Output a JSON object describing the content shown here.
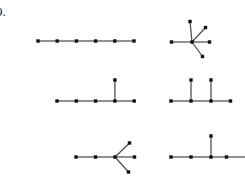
{
  "figure": {
    "label": "9.",
    "background_color": "#ffffff",
    "node_color": "#111111",
    "edge_color": "#4d4d4d",
    "node_size": 3.4,
    "edge_width": 1.25,
    "width": 245,
    "height": 186
  },
  "graphs": [
    {
      "id": "graph-top-left",
      "name": "path-six-nodes",
      "description": "Path graph on 6 vertices",
      "nodes": [
        {
          "id": "n0",
          "x": 38.0,
          "y": 41.0
        },
        {
          "id": "n1",
          "x": 57.2,
          "y": 41.0
        },
        {
          "id": "n2",
          "x": 76.4,
          "y": 41.0
        },
        {
          "id": "n3",
          "x": 95.6,
          "y": 41.0
        },
        {
          "id": "n4",
          "x": 114.8,
          "y": 41.0
        },
        {
          "id": "n5",
          "x": 134.0,
          "y": 41.0
        }
      ],
      "edges": [
        [
          "n0",
          "n1"
        ],
        [
          "n1",
          "n2"
        ],
        [
          "n2",
          "n3"
        ],
        [
          "n3",
          "n4"
        ],
        [
          "n4",
          "n5"
        ]
      ]
    },
    {
      "id": "graph-top-right",
      "name": "star-five-leaves",
      "description": "Star graph with one centre and five leaves",
      "nodes": [
        {
          "id": "c",
          "x": 192.0,
          "y": 42.0
        },
        {
          "id": "l0",
          "x": 171.5,
          "y": 42.0
        },
        {
          "id": "l1",
          "x": 190.0,
          "y": 21.5
        },
        {
          "id": "l2",
          "x": 205.5,
          "y": 27.5
        },
        {
          "id": "l3",
          "x": 209.5,
          "y": 42.0
        },
        {
          "id": "l4",
          "x": 202.5,
          "y": 56.5
        }
      ],
      "edges": [
        [
          "c",
          "l0"
        ],
        [
          "c",
          "l1"
        ],
        [
          "c",
          "l2"
        ],
        [
          "c",
          "l3"
        ],
        [
          "c",
          "l4"
        ]
      ]
    },
    {
      "id": "graph-mid-left",
      "name": "path-five-with-branch-at-fourth",
      "description": "Path on 5 vertices with one pendant vertex above the fourth",
      "nodes": [
        {
          "id": "n0",
          "x": 57.0,
          "y": 101.0
        },
        {
          "id": "n1",
          "x": 76.3,
          "y": 101.0
        },
        {
          "id": "n2",
          "x": 95.6,
          "y": 101.0
        },
        {
          "id": "n3",
          "x": 114.9,
          "y": 101.0
        },
        {
          "id": "n4",
          "x": 134.2,
          "y": 101.0
        },
        {
          "id": "b0",
          "x": 114.9,
          "y": 80.0
        }
      ],
      "edges": [
        [
          "n0",
          "n1"
        ],
        [
          "n1",
          "n2"
        ],
        [
          "n2",
          "n3"
        ],
        [
          "n3",
          "n4"
        ],
        [
          "n3",
          "b0"
        ]
      ]
    },
    {
      "id": "graph-mid-right",
      "name": "path-four-with-two-branches",
      "description": "Path on 4 vertices with pendant vertices above the second and third",
      "nodes": [
        {
          "id": "n0",
          "x": 171.0,
          "y": 101.0
        },
        {
          "id": "n1",
          "x": 191.0,
          "y": 101.0
        },
        {
          "id": "n2",
          "x": 211.0,
          "y": 101.0
        },
        {
          "id": "n3",
          "x": 230.5,
          "y": 101.0
        },
        {
          "id": "b0",
          "x": 191.0,
          "y": 80.0
        },
        {
          "id": "b1",
          "x": 211.0,
          "y": 80.0
        }
      ],
      "edges": [
        [
          "n0",
          "n1"
        ],
        [
          "n1",
          "n2"
        ],
        [
          "n2",
          "n3"
        ],
        [
          "n1",
          "b0"
        ],
        [
          "n2",
          "b1"
        ]
      ]
    },
    {
      "id": "graph-bottom-left",
      "name": "path-three-with-three-way-fan",
      "description": "Path on 3 vertices ending in a vertex with three spread branches",
      "nodes": [
        {
          "id": "n0",
          "x": 76.0,
          "y": 157.0
        },
        {
          "id": "n1",
          "x": 95.5,
          "y": 157.0
        },
        {
          "id": "n2",
          "x": 115.0,
          "y": 157.0
        },
        {
          "id": "b0",
          "x": 129.5,
          "y": 143.0
        },
        {
          "id": "b1",
          "x": 134.5,
          "y": 157.0
        },
        {
          "id": "b2",
          "x": 128.5,
          "y": 172.0
        }
      ],
      "edges": [
        [
          "n0",
          "n1"
        ],
        [
          "n1",
          "n2"
        ],
        [
          "n2",
          "b0"
        ],
        [
          "n2",
          "b1"
        ],
        [
          "n2",
          "b2"
        ]
      ]
    },
    {
      "id": "graph-bottom-right",
      "name": "path-four-with-branch-at-third",
      "description": "Path on 4 vertices with one pendant vertex above the third; right edge runs off the figure",
      "nodes": [
        {
          "id": "n0",
          "x": 171.0,
          "y": 157.0
        },
        {
          "id": "n1",
          "x": 191.0,
          "y": 157.0
        },
        {
          "id": "n2",
          "x": 211.0,
          "y": 157.0
        },
        {
          "id": "n3",
          "x": 226.5,
          "y": 157.0
        },
        {
          "id": "b0",
          "x": 211.0,
          "y": 136.0
        }
      ],
      "edges": [
        [
          "n0",
          "n1"
        ],
        [
          "n1",
          "n2"
        ],
        [
          "n2",
          "n3"
        ],
        [
          "n3",
          "clip"
        ],
        [
          "n2",
          "b0"
        ]
      ],
      "clip_point": {
        "x": 245.0,
        "y": 157.0
      }
    }
  ]
}
